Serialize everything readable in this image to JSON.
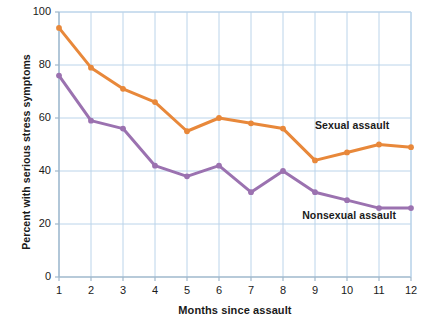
{
  "chart_data": {
    "type": "line",
    "title": "",
    "xlabel": "Months since assault",
    "ylabel": "Percent with serious stress symptoms",
    "x": [
      1,
      2,
      3,
      4,
      5,
      6,
      7,
      8,
      9,
      10,
      11,
      12
    ],
    "xlim": [
      1,
      12
    ],
    "ylim": [
      0,
      100
    ],
    "yticks": [
      0,
      20,
      40,
      60,
      80,
      100
    ],
    "xticks": [
      1,
      2,
      3,
      4,
      5,
      6,
      7,
      8,
      9,
      10,
      11,
      12
    ],
    "grid": true,
    "legend_position": "inline-annotations",
    "series": [
      {
        "name": "Sexual assault",
        "color": "#E8883A",
        "values": [
          94,
          79,
          71,
          66,
          55,
          60,
          58,
          56,
          44,
          47,
          50,
          49
        ],
        "label_x": 9,
        "label_y": 57
      },
      {
        "name": "Nonsexual assault",
        "color": "#9B72B0",
        "values": [
          76,
          59,
          56,
          42,
          38,
          42,
          32,
          40,
          32,
          29,
          26,
          26
        ],
        "label_x": 8.6,
        "label_y": 23
      }
    ]
  },
  "axes": {
    "y_tick_labels": [
      "100",
      "80",
      "60",
      "40",
      "20",
      "0"
    ],
    "x_tick_labels": [
      "1",
      "2",
      "3",
      "4",
      "5",
      "6",
      "7",
      "8",
      "9",
      "10",
      "11",
      "12"
    ],
    "x_title": "Months since assault",
    "y_title": "Percent with serious stress symptoms"
  },
  "colors": {
    "sexual_assault": "#E8883A",
    "nonsexual_assault": "#9B72B0",
    "grid": "#BBD4EA",
    "axis": "#9FB8CC",
    "text": "#1a1a1a",
    "background": "#ffffff"
  }
}
